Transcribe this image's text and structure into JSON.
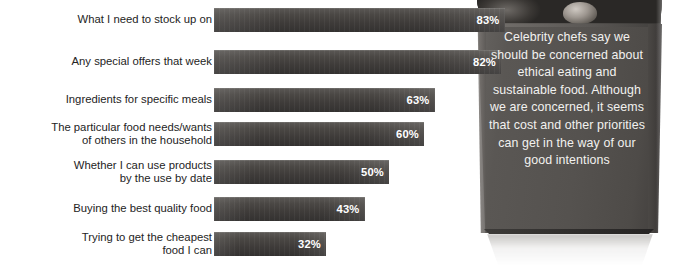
{
  "chart_data": {
    "type": "bar",
    "orientation": "horizontal",
    "title": "",
    "xlabel": "",
    "ylabel": "",
    "xlim": [
      0,
      100
    ],
    "grid": false,
    "legend": "none",
    "value_suffix": "%",
    "categories": [
      "What I need to stock up on",
      "Any special offers that week",
      "Ingredients for specific meals",
      "The particular food needs/wants\nof others in the household",
      "Whether I can use products\nby the use by date",
      "Buying the best quality food",
      "Trying to get the cheapest\nfood I can"
    ],
    "values": [
      83,
      82,
      63,
      60,
      50,
      43,
      32
    ],
    "value_labels": [
      "83%",
      "82%",
      "63%",
      "60%",
      "50%",
      "43%",
      "32%"
    ]
  },
  "annotation": {
    "quote": "Celebrity chefs say we should be concerned about ethical eating and sustainable food. Although we are concerned, it seems that cost and other priorities can get in the way of our good intentions"
  },
  "colors": {
    "bar_dark": "#3e3b39",
    "bar_light": "#5b5855",
    "value_text": "#ffffff",
    "label_text": "#242424",
    "quote_text": "#f2f1ef",
    "bag": "#55524f",
    "background": "#ffffff"
  }
}
